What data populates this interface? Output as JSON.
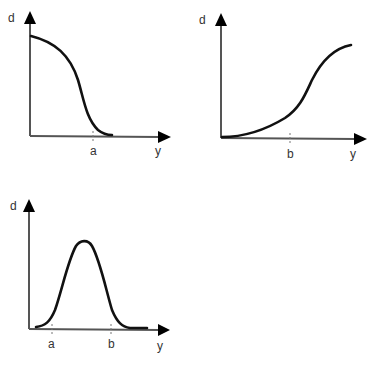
{
  "panels": [
    {
      "id": "top-left",
      "y_label": "d",
      "x_label": "y",
      "ticks": [
        {
          "label": "a"
        }
      ],
      "description": "Decreasing sigmoid: d starts high at y=0 and falls to ~0 around y=a"
    },
    {
      "id": "top-right",
      "y_label": "d",
      "x_label": "y",
      "ticks": [
        {
          "label": "b"
        }
      ],
      "description": "Increasing sigmoid: d starts ~0 and rises, inflection after y=b, plateaus high"
    },
    {
      "id": "bottom-left",
      "y_label": "d",
      "x_label": "y",
      "ticks": [
        {
          "label": "a"
        },
        {
          "label": "b"
        }
      ],
      "description": "Bell-shaped curve: d near 0 outside, peaks between a and b"
    }
  ]
}
